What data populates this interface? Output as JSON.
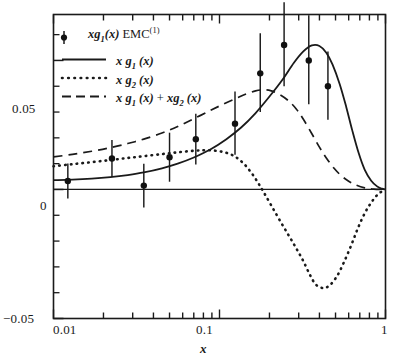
{
  "chart_data": {
    "type": "line",
    "title": "",
    "xlabel": "x",
    "ylabel": "",
    "xscale": "log",
    "yscale": "linear",
    "xlim": [
      0.01,
      1.0
    ],
    "ylim": [
      -0.05,
      0.0678
    ],
    "grid": false,
    "legend_position": "upper-left",
    "xticklabels": [
      "0.01",
      "0.1",
      "1"
    ],
    "xtickvalues": [
      0.01,
      0.1,
      1
    ],
    "yticklabels": [
      "0.05",
      "0",
      "-0.05"
    ],
    "ytickvalues": [
      0.05,
      0,
      -0.05
    ],
    "yminorticks": [
      -0.04,
      -0.03,
      -0.02,
      -0.01,
      0.01,
      0.02,
      0.03,
      0.04,
      0.06
    ],
    "legend": [
      {
        "key": "emc",
        "label_html": "<i>xg</i><sub>1</sub><i>(x)</i> EMC<sup>(1)</sup>",
        "marker": "filled-circle-errorbar"
      },
      {
        "key": "g1",
        "label_html": "<i>x g</i><sub>1</sub> <i>(x)</i>",
        "marker": "solid-line"
      },
      {
        "key": "g2",
        "label_html": "<i>x g</i><sub>2</sub> <i>(x)</i>",
        "marker": "dotted-line"
      },
      {
        "key": "sum",
        "label_html": "<i>x g</i><sub>1</sub> <i>(x)</i> + <i>xg</i><sub>2</sub> <i>(x)</i>",
        "marker": "dashed-line"
      }
    ],
    "series": [
      {
        "name": "xg1(x) EMC(1)",
        "type": "scatter-errorbar",
        "marker": "filled-circle",
        "points": [
          {
            "x": 0.0122,
            "y": 0.0033,
            "yerr_low": 0.0068,
            "yerr_high": 0.0068
          },
          {
            "x": 0.0225,
            "y": 0.012,
            "yerr_low": 0.0072,
            "yerr_high": 0.0072
          },
          {
            "x": 0.035,
            "y": 0.0015,
            "yerr_low": 0.0085,
            "yerr_high": 0.0085
          },
          {
            "x": 0.05,
            "y": 0.0125,
            "yerr_low": 0.0095,
            "yerr_high": 0.0095
          },
          {
            "x": 0.072,
            "y": 0.0195,
            "yerr_low": 0.0098,
            "yerr_high": 0.0098
          },
          {
            "x": 0.124,
            "y": 0.0255,
            "yerr_low": 0.012,
            "yerr_high": 0.0125
          },
          {
            "x": 0.176,
            "y": 0.045,
            "yerr_low": 0.015,
            "yerr_high": 0.0155
          },
          {
            "x": 0.245,
            "y": 0.056,
            "yerr_low": 0.016,
            "yerr_high": 0.0165
          },
          {
            "x": 0.345,
            "y": 0.05,
            "yerr_low": 0.017,
            "yerr_high": 0.0175
          },
          {
            "x": 0.45,
            "y": 0.04,
            "yerr_low": 0.013,
            "yerr_high": 0.0135
          }
        ]
      },
      {
        "name": "x g1 (x)",
        "type": "line",
        "style": "solid",
        "points": [
          {
            "x": 0.01,
            "y": 0.0036
          },
          {
            "x": 0.013,
            "y": 0.0038
          },
          {
            "x": 0.017,
            "y": 0.0042
          },
          {
            "x": 0.022,
            "y": 0.0048
          },
          {
            "x": 0.028,
            "y": 0.0056
          },
          {
            "x": 0.035,
            "y": 0.0066
          },
          {
            "x": 0.045,
            "y": 0.0082
          },
          {
            "x": 0.056,
            "y": 0.01
          },
          {
            "x": 0.07,
            "y": 0.0124
          },
          {
            "x": 0.088,
            "y": 0.0155
          },
          {
            "x": 0.11,
            "y": 0.0195
          },
          {
            "x": 0.135,
            "y": 0.024
          },
          {
            "x": 0.165,
            "y": 0.0296
          },
          {
            "x": 0.2,
            "y": 0.036
          },
          {
            "x": 0.24,
            "y": 0.0426
          },
          {
            "x": 0.28,
            "y": 0.049
          },
          {
            "x": 0.32,
            "y": 0.0535
          },
          {
            "x": 0.36,
            "y": 0.0558
          },
          {
            "x": 0.4,
            "y": 0.0556
          },
          {
            "x": 0.44,
            "y": 0.053
          },
          {
            "x": 0.48,
            "y": 0.0484
          },
          {
            "x": 0.53,
            "y": 0.0408
          },
          {
            "x": 0.58,
            "y": 0.032
          },
          {
            "x": 0.63,
            "y": 0.023
          },
          {
            "x": 0.69,
            "y": 0.014
          },
          {
            "x": 0.75,
            "y": 0.0076
          },
          {
            "x": 0.82,
            "y": 0.0034
          },
          {
            "x": 0.89,
            "y": 0.0012
          },
          {
            "x": 0.95,
            "y": 0.0003
          },
          {
            "x": 1.0,
            "y": 0.0
          }
        ]
      },
      {
        "name": "x g2 (x)",
        "type": "line",
        "style": "dotted",
        "points": [
          {
            "x": 0.01,
            "y": 0.009
          },
          {
            "x": 0.013,
            "y": 0.0098
          },
          {
            "x": 0.017,
            "y": 0.0106
          },
          {
            "x": 0.022,
            "y": 0.0114
          },
          {
            "x": 0.028,
            "y": 0.0122
          },
          {
            "x": 0.035,
            "y": 0.0129
          },
          {
            "x": 0.045,
            "y": 0.0137
          },
          {
            "x": 0.056,
            "y": 0.0144
          },
          {
            "x": 0.07,
            "y": 0.015
          },
          {
            "x": 0.082,
            "y": 0.0152
          },
          {
            "x": 0.095,
            "y": 0.015
          },
          {
            "x": 0.11,
            "y": 0.0142
          },
          {
            "x": 0.125,
            "y": 0.0126
          },
          {
            "x": 0.14,
            "y": 0.01
          },
          {
            "x": 0.155,
            "y": 0.0066
          },
          {
            "x": 0.17,
            "y": 0.0028
          },
          {
            "x": 0.185,
            "y": -0.0012
          },
          {
            "x": 0.205,
            "y": -0.0062
          },
          {
            "x": 0.23,
            "y": -0.0118
          },
          {
            "x": 0.26,
            "y": -0.0176
          },
          {
            "x": 0.29,
            "y": -0.0228
          },
          {
            "x": 0.32,
            "y": -0.0278
          },
          {
            "x": 0.35,
            "y": -0.033
          },
          {
            "x": 0.38,
            "y": -0.0368
          },
          {
            "x": 0.42,
            "y": -0.0382
          },
          {
            "x": 0.46,
            "y": -0.0372
          },
          {
            "x": 0.51,
            "y": -0.0336
          },
          {
            "x": 0.56,
            "y": -0.0284
          },
          {
            "x": 0.62,
            "y": -0.0218
          },
          {
            "x": 0.68,
            "y": -0.0152
          },
          {
            "x": 0.75,
            "y": -0.0092
          },
          {
            "x": 0.83,
            "y": -0.0046
          },
          {
            "x": 0.91,
            "y": -0.0016
          },
          {
            "x": 1.0,
            "y": 0.0
          }
        ]
      },
      {
        "name": "x g1 (x) + xg2 (x)",
        "type": "line",
        "style": "dashed",
        "points": [
          {
            "x": 0.01,
            "y": 0.0126
          },
          {
            "x": 0.013,
            "y": 0.0136
          },
          {
            "x": 0.017,
            "y": 0.0148
          },
          {
            "x": 0.022,
            "y": 0.0162
          },
          {
            "x": 0.028,
            "y": 0.0178
          },
          {
            "x": 0.035,
            "y": 0.0195
          },
          {
            "x": 0.045,
            "y": 0.0219
          },
          {
            "x": 0.056,
            "y": 0.0244
          },
          {
            "x": 0.07,
            "y": 0.0274
          },
          {
            "x": 0.088,
            "y": 0.0306
          },
          {
            "x": 0.105,
            "y": 0.033
          },
          {
            "x": 0.125,
            "y": 0.0352
          },
          {
            "x": 0.145,
            "y": 0.037
          },
          {
            "x": 0.165,
            "y": 0.0382
          },
          {
            "x": 0.185,
            "y": 0.0386
          },
          {
            "x": 0.205,
            "y": 0.0382
          },
          {
            "x": 0.23,
            "y": 0.0368
          },
          {
            "x": 0.26,
            "y": 0.0344
          },
          {
            "x": 0.29,
            "y": 0.0312
          },
          {
            "x": 0.32,
            "y": 0.0272
          },
          {
            "x": 0.36,
            "y": 0.0216
          },
          {
            "x": 0.4,
            "y": 0.0164
          },
          {
            "x": 0.44,
            "y": 0.0122
          },
          {
            "x": 0.49,
            "y": 0.0082
          },
          {
            "x": 0.54,
            "y": 0.0054
          },
          {
            "x": 0.6,
            "y": 0.0032
          },
          {
            "x": 0.67,
            "y": 0.0016
          },
          {
            "x": 0.75,
            "y": 0.0006
          },
          {
            "x": 0.85,
            "y": 0.0001
          },
          {
            "x": 1.0,
            "y": 0.0
          }
        ]
      }
    ]
  },
  "axes": {
    "ylabel_005": "0.05",
    "ylabel_0": "0",
    "ylabel_neg005": "−0.05",
    "xlabel_001": "0.01",
    "xlabel_01": "0.1",
    "xlabel_1": "1",
    "xaxis_name": "x"
  },
  "colors": {
    "axis": "#1a1a1a",
    "curve": "#1a1a1a",
    "marker": "#111111",
    "background": "#ffffff"
  }
}
